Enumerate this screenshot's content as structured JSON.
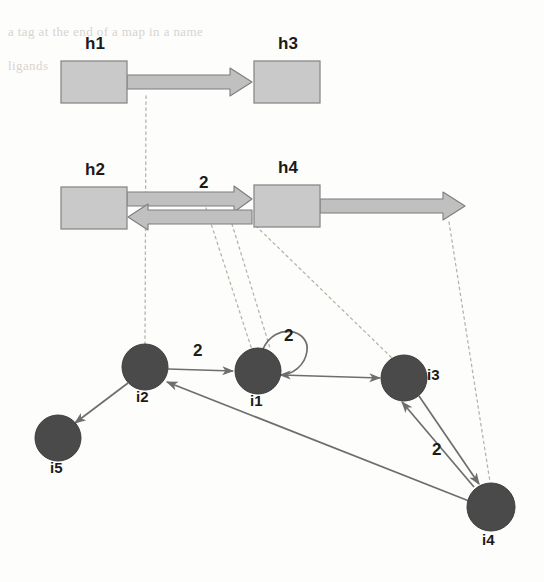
{
  "figure": {
    "title": "",
    "background_color": "#fdfdfc",
    "box_fill": "#c9c9c9",
    "box_stroke": "#8a8a8a",
    "node_fill": "#4a4a4a",
    "node_stroke": "#3c3c3c",
    "edge_color": "#6e6e6e",
    "block_arrow_fill": "#c0c0c0",
    "block_arrow_stroke": "#7d7d7d",
    "dotted_color": "#b9b4ab",
    "text_color": "#1b1b1b"
  },
  "ghost_text": [
    {
      "id": "ghost-line-1",
      "text": "a tag at the end of a map in a name",
      "x": 8,
      "y": 34
    },
    {
      "id": "ghost-line-2",
      "text": "ligands",
      "x": 8,
      "y": 68
    }
  ],
  "host_graph": {
    "name": "host-graph",
    "boxes": [
      {
        "id": "h1",
        "label": "h1",
        "x": 61,
        "y": 61,
        "w": 66,
        "h": 42,
        "label_x": 85,
        "label_y": 34
      },
      {
        "id": "h3",
        "label": "h3",
        "x": 254,
        "y": 61,
        "w": 66,
        "h": 42,
        "label_x": 278,
        "label_y": 34
      },
      {
        "id": "h2",
        "label": "h2",
        "x": 61,
        "y": 187,
        "w": 66,
        "h": 42,
        "label_x": 85,
        "label_y": 160
      },
      {
        "id": "h4",
        "label": "h4",
        "x": 254,
        "y": 185,
        "w": 66,
        "h": 42,
        "label_x": 278,
        "label_y": 158
      }
    ],
    "edges": [
      {
        "id": "h1-to-h3",
        "from": "h1",
        "to": "h3",
        "x1": 127,
        "y1": 82,
        "x2": 252,
        "y2": 82,
        "weight": "",
        "style": "block-arrow"
      },
      {
        "id": "h2-to-h4",
        "from": "h2",
        "to": "h4",
        "x1": 127,
        "y1": 196,
        "x2": 252,
        "y2": 196,
        "weight": "2",
        "style": "block-arrow"
      },
      {
        "id": "h4-to-h2",
        "from": "h4",
        "to": "h2",
        "x1": 252,
        "y1": 216,
        "x2": 127,
        "y2": 216,
        "weight": "",
        "style": "block-arrow"
      },
      {
        "id": "h4-outgoing",
        "from": "h4",
        "to": "",
        "x1": 320,
        "y1": 206,
        "x2": 465,
        "y2": 206,
        "weight": "",
        "style": "block-arrow"
      }
    ],
    "edge_weight_labels": [
      {
        "id": "h2-h4-weight",
        "text": "2",
        "x": 199,
        "y": 175
      }
    ]
  },
  "instance_graph": {
    "name": "instance-graph",
    "nodes": [
      {
        "id": "i5",
        "label": "i5",
        "cx": 58,
        "cy": 438,
        "r": 23,
        "label_x": 50,
        "label_y": 466
      },
      {
        "id": "i2",
        "label": "i2",
        "cx": 145,
        "cy": 367,
        "r": 23,
        "label_x": 136,
        "label_y": 395
      },
      {
        "id": "i1",
        "label": "i1",
        "cx": 258,
        "cy": 371,
        "r": 23,
        "label_x": 250,
        "label_y": 399
      },
      {
        "id": "i3",
        "label": "i3",
        "cx": 404,
        "cy": 378,
        "r": 23,
        "label_x": 429,
        "label_y": 371
      },
      {
        "id": "i4",
        "label": "i4",
        "cx": 491,
        "cy": 507,
        "r": 24,
        "label_x": 482,
        "label_y": 538
      }
    ],
    "edges": [
      {
        "id": "i2-to-i5",
        "from": "i2",
        "to": "i5",
        "weight": "",
        "style": "line-arrow"
      },
      {
        "id": "i2-to-i1",
        "from": "i2",
        "to": "i1",
        "weight": "2",
        "style": "line-arrow"
      },
      {
        "id": "i1-self-loop",
        "from": "i1",
        "to": "i1",
        "weight": "2",
        "style": "self-loop"
      },
      {
        "id": "i1-to-i3",
        "from": "i1",
        "to": "i3",
        "weight": "",
        "style": "line-arrow"
      },
      {
        "id": "i3-to-i4",
        "from": "i3",
        "to": "i4",
        "weight": "2",
        "style": "line-arrow"
      },
      {
        "id": "i4-to-i3",
        "from": "i4",
        "to": "i3",
        "weight": "",
        "style": "line-arrow"
      },
      {
        "id": "i4-to-i2",
        "from": "i4",
        "to": "i2",
        "weight": "",
        "style": "line-arrow"
      }
    ],
    "edge_weight_labels": [
      {
        "id": "i2-i1-weight",
        "text": "2",
        "x": 193,
        "y": 344
      },
      {
        "id": "i1-self-weight",
        "text": "2",
        "x": 286,
        "y": 329
      },
      {
        "id": "i3-i4-weight",
        "text": "2",
        "x": 434,
        "y": 444
      }
    ]
  },
  "mapping_lines": [
    {
      "id": "map-h1h3-to-i2",
      "from": "h1-to-h3 edge",
      "to": "i2",
      "x1": 146,
      "y1": 96,
      "x2": 145,
      "y2": 344
    },
    {
      "id": "map-h2h4-to-i1",
      "from": "h2-to-h4 edge",
      "to": "i1",
      "x1": 206,
      "y1": 208,
      "x2": 252,
      "y2": 350
    },
    {
      "id": "map-h4-to-i3",
      "from": "h4 box",
      "to": "i3",
      "x1": 256,
      "y1": 226,
      "x2": 392,
      "y2": 358
    },
    {
      "id": "map-h4out-to-i4",
      "from": "h4-outgoing arrow",
      "to": "i4",
      "x1": 449,
      "y1": 222,
      "x2": 490,
      "y2": 482
    }
  ]
}
